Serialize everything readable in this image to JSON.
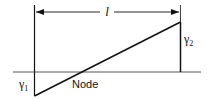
{
  "diagram": {
    "length_label": "l",
    "gamma1": {
      "symbol": "γ",
      "sub": "1"
    },
    "gamma2": {
      "symbol": "γ",
      "sub": "2"
    },
    "node_label": "Node",
    "colors": {
      "line": "#111111",
      "baseline": "#555555",
      "background": "#ffffff"
    }
  }
}
